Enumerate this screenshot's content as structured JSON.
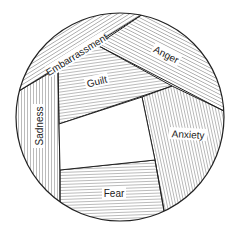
{
  "diagram": {
    "type": "emotion-circle",
    "colors": {
      "stroke": "#222222",
      "hatch": "#555555",
      "background": "#ffffff"
    },
    "regions": [
      {
        "id": "embarrassment",
        "label": "Embarrassment",
        "hatch": "diagonal-parallel-to-band"
      },
      {
        "id": "anger",
        "label": "Anger",
        "hatch": "diagonal"
      },
      {
        "id": "guilt",
        "label": "Guilt",
        "hatch": "diagonal-shallow"
      },
      {
        "id": "sadness",
        "label": "Sadness",
        "hatch": "vertical"
      },
      {
        "id": "anxiety",
        "label": "Anxiety",
        "hatch": "steep-diagonal"
      },
      {
        "id": "fear",
        "label": "Fear",
        "hatch": "horizontal"
      },
      {
        "id": "center",
        "label": "",
        "hatch": "none"
      }
    ]
  }
}
